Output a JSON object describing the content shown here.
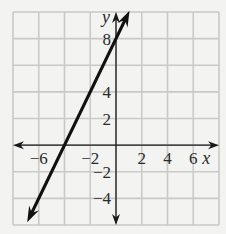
{
  "chart_data": {
    "type": "line",
    "title": "",
    "xlabel": "x",
    "ylabel": "y",
    "xlim": [
      -8,
      8
    ],
    "ylim": [
      -6,
      10
    ],
    "grid": true,
    "grid_step": 2,
    "x_ticks": [
      {
        "value": -6,
        "label": "−6"
      },
      {
        "value": -2,
        "label": "−2"
      },
      {
        "value": 2,
        "label": "2"
      },
      {
        "value": 4,
        "label": "4"
      },
      {
        "value": 6,
        "label": "6"
      }
    ],
    "y_ticks": [
      {
        "value": 8,
        "label": "8"
      },
      {
        "value": 4,
        "label": "4"
      },
      {
        "value": 2,
        "label": "2"
      },
      {
        "value": -2,
        "label": "−2"
      },
      {
        "value": -4,
        "label": "−4"
      }
    ],
    "series": [
      {
        "name": "y = 2x + 8",
        "slope": 2,
        "intercept": 8,
        "x": [
          -6.9,
          1.05
        ],
        "y": [
          -5.8,
          10.1
        ],
        "arrows": "both",
        "color": "#111111"
      }
    ]
  },
  "colors": {
    "background": "#f3f3f1",
    "grid": "#c9c9c9",
    "axis": "#1a1a1a",
    "line": "#111111"
  }
}
